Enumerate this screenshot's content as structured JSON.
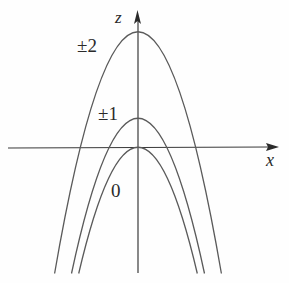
{
  "diagram": {
    "axes": {
      "horizontal_label": "x",
      "vertical_label": "z"
    },
    "curves": [
      {
        "label": "±2",
        "k": 2,
        "peak_z": 4
      },
      {
        "label": "±1",
        "k": 1,
        "peak_z": 1
      },
      {
        "label": "0",
        "k": 0,
        "peak_z": 0
      }
    ],
    "colors": {
      "curve": "#5a5a5a",
      "axis": "#3a3a3a",
      "text": "#2a2a2a"
    }
  }
}
